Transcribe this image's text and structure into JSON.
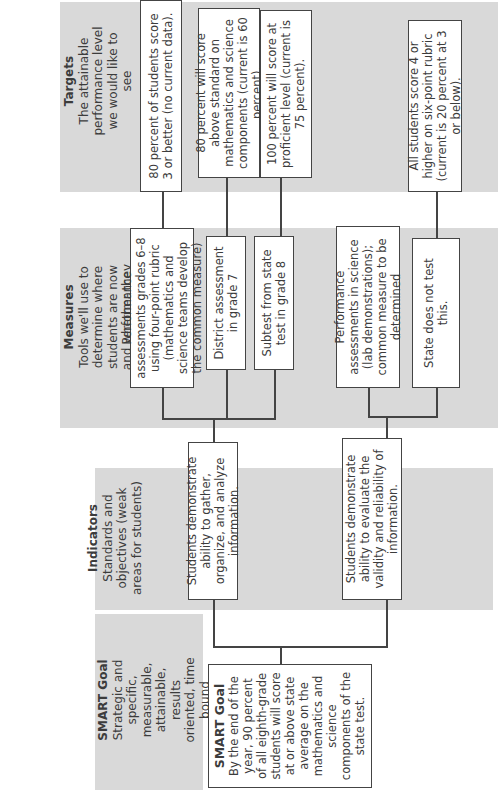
{
  "columns": {
    "smart_goal": {
      "title": "SMART Goal",
      "description": "Strategic and specific, measurable, attainable, results oriented, time bound"
    },
    "indicators": {
      "title": "Indicators",
      "description": "Standards and objectives (weak areas for students)"
    },
    "measures": {
      "title": "Measures",
      "description": "Tools we'll use to determine where students are now and whether they are improving"
    },
    "targets": {
      "title": "Targets",
      "description": "The attainable performance level we would like to see"
    }
  },
  "goal_box": {
    "title": "SMART Goal",
    "text": "By the end of the year, 90 percent of all eighth-grade students will score at or above state average on the mathematics and science components of the state test."
  },
  "indicators": [
    {
      "text": "Students demonstrate ability to gather, organize, and analyze information."
    },
    {
      "text": "Students demonstrate ability to evaluate the validity and reliability of information."
    }
  ],
  "measures": [
    {
      "text": "Performance assessments grades 6–8 using four-point rubric (mathematics and science teams develop the common measure)"
    },
    {
      "text": "District assessment in grade 7"
    },
    {
      "text": "Subtest from state test in grade 8"
    },
    {
      "text": "Performance assessments in science (lab demonstrations); common measure to be determined"
    },
    {
      "text": "State does not test this."
    }
  ],
  "targets": [
    {
      "text": "80 percent of students score 3 or better (no current data)."
    },
    {
      "text": "80 percent will score above standard on mathematics and science components (current is 60 percent)."
    },
    {
      "text": "100 percent will score at proficient level (current is 75 percent)."
    },
    {
      "text": "All students score 4 or higher on six-point rubric (current is 20 percent at 3 or below)."
    }
  ]
}
